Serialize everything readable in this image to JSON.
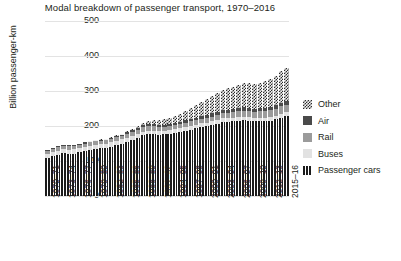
{
  "chart_data": {
    "type": "bar",
    "title": "Modal breakdown of passenger transport, 1970–2016",
    "xlabel": "",
    "ylabel": "Billion passenger-km",
    "ylim": [
      0,
      500
    ],
    "yticks": [
      0,
      100,
      200,
      300,
      400,
      500
    ],
    "grid": true,
    "stacked": true,
    "legend_position": "right",
    "legend": [
      "Other",
      "Air",
      "Rail",
      "Buses",
      "Passenger cars"
    ],
    "categories": [
      "1970–71",
      "1971–72",
      "1972–73",
      "1973–74",
      "1974–75",
      "1975–76",
      "1976–77",
      "1977–78",
      "1978–79",
      "1979–80",
      "1980–81",
      "1981–82",
      "1982–83",
      "1983–84",
      "1984–85",
      "1985–86",
      "1986–87",
      "1987–88",
      "1988–89",
      "1989–90",
      "1990–91",
      "1991–92",
      "1992–93",
      "1993–94",
      "1994–95",
      "1995–96",
      "1996–97",
      "1997–98",
      "1998–99",
      "1999–00",
      "2000–01",
      "2001–02",
      "2002–03",
      "2003–04",
      "2004–05",
      "2005–06",
      "2006–07",
      "2007–08",
      "2008–09",
      "2009–10",
      "2010–11",
      "2011–12",
      "2012–13",
      "2013–14",
      "2014–15",
      "2015–16"
    ],
    "xtick_labels": [
      "1970–71",
      "1973–74",
      "1976–77",
      "1979–80",
      "1982–83",
      "1985–86",
      "1988–89",
      "1991–92",
      "1994–95",
      "1997–98",
      "2000–01",
      "2003–04",
      "2006–07",
      "2009–10",
      "2012–13",
      "2015–16"
    ],
    "xtick_indices": [
      0,
      3,
      6,
      9,
      12,
      15,
      18,
      21,
      24,
      27,
      30,
      33,
      36,
      39,
      42,
      45
    ],
    "series": [
      {
        "name": "Passenger cars",
        "values": [
          108,
          113,
          118,
          122,
          120,
          121,
          125,
          128,
          131,
          134,
          136,
          138,
          141,
          146,
          150,
          155,
          161,
          167,
          173,
          176,
          176,
          175,
          176,
          178,
          180,
          183,
          187,
          190,
          193,
          197,
          199,
          203,
          207,
          211,
          212,
          213,
          215,
          216,
          214,
          213,
          213,
          213,
          215,
          219,
          224,
          228
        ]
      },
      {
        "name": "Buses",
        "values": [
          12,
          12,
          12,
          12,
          12,
          12,
          12,
          12,
          12,
          12,
          12,
          12,
          12,
          12,
          12,
          11,
          11,
          11,
          11,
          11,
          11,
          11,
          11,
          11,
          11,
          11,
          11,
          11,
          11,
          11,
          11,
          11,
          11,
          11,
          11,
          11,
          11,
          11,
          11,
          11,
          11,
          11,
          11,
          11,
          11,
          11
        ]
      },
      {
        "name": "Rail",
        "values": [
          10,
          10,
          10,
          10,
          10,
          10,
          10,
          10,
          10,
          10,
          10,
          10,
          10,
          10,
          10,
          11,
          11,
          11,
          12,
          12,
          12,
          11,
          11,
          11,
          11,
          11,
          11,
          12,
          12,
          13,
          13,
          13,
          13,
          14,
          14,
          15,
          16,
          17,
          17,
          17,
          18,
          19,
          19,
          20,
          21,
          22
        ]
      },
      {
        "name": "Air",
        "values": [
          2,
          2,
          2,
          3,
          3,
          3,
          3,
          3,
          3,
          3,
          3,
          3,
          4,
          4,
          4,
          5,
          5,
          5,
          6,
          6,
          6,
          6,
          6,
          7,
          7,
          7,
          8,
          8,
          8,
          9,
          9,
          9,
          9,
          10,
          10,
          10,
          10,
          10,
          10,
          9,
          9,
          9,
          9,
          9,
          10,
          10
        ]
      },
      {
        "name": "Other",
        "values": [
          0,
          0,
          0,
          0,
          0,
          0,
          0,
          0,
          1,
          1,
          1,
          1,
          1,
          2,
          2,
          3,
          4,
          5,
          7,
          9,
          11,
          13,
          15,
          17,
          20,
          23,
          27,
          31,
          35,
          40,
          45,
          49,
          53,
          58,
          61,
          63,
          66,
          69,
          70,
          71,
          73,
          76,
          80,
          85,
          90,
          95
        ]
      }
    ]
  }
}
